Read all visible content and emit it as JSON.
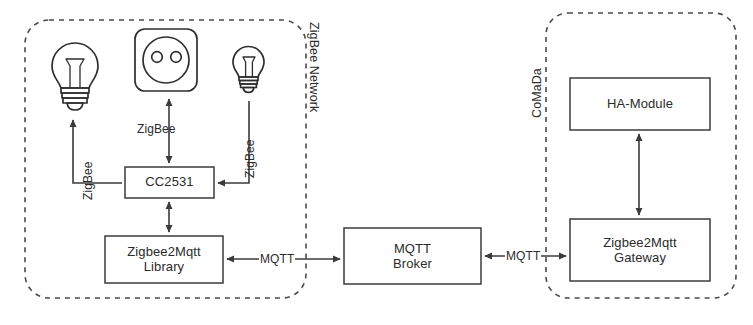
{
  "diagram": {
    "title_present": false,
    "groups": [
      {
        "id": "zigbee-network",
        "label": "ZigBee Network"
      },
      {
        "id": "comada",
        "label": "CoMaDa"
      }
    ],
    "nodes": [
      {
        "id": "lamp-left",
        "kind": "lightbulb-icon",
        "label": ""
      },
      {
        "id": "socket",
        "kind": "power-socket-icon",
        "label": ""
      },
      {
        "id": "lamp-right",
        "kind": "lightbulb-icon",
        "label": ""
      },
      {
        "id": "cc2531",
        "kind": "box",
        "label": "CC2531"
      },
      {
        "id": "zigbee2mqtt-library",
        "kind": "box",
        "label": "Zigbee2Mqtt\nLibrary"
      },
      {
        "id": "mqtt-broker",
        "kind": "box",
        "label": "MQTT\nBroker"
      },
      {
        "id": "ha-module",
        "kind": "box",
        "label": "HA-Module"
      },
      {
        "id": "zigbee2mqtt-gateway",
        "kind": "box",
        "label": "Zigbee2Mqtt\nGateway"
      }
    ],
    "edges": [
      {
        "id": "cc2531-lamp-left",
        "label": "ZigBee",
        "from": "cc2531",
        "to": "lamp-left",
        "arrows": "single"
      },
      {
        "id": "cc2531-socket",
        "label": "ZigBee",
        "from": "cc2531",
        "to": "socket",
        "arrows": "double"
      },
      {
        "id": "cc2531-lamp-right",
        "label": "ZigBee",
        "from": "lamp-right",
        "to": "cc2531",
        "arrows": "single"
      },
      {
        "id": "cc2531-library",
        "label": "",
        "from": "cc2531",
        "to": "zigbee2mqtt-library",
        "arrows": "double"
      },
      {
        "id": "library-broker",
        "label": "MQTT",
        "from": "zigbee2mqtt-library",
        "to": "mqtt-broker",
        "arrows": "double"
      },
      {
        "id": "broker-gateway",
        "label": "MQTT",
        "from": "mqtt-broker",
        "to": "zigbee2mqtt-gateway",
        "arrows": "double"
      },
      {
        "id": "gateway-ha",
        "label": "",
        "from": "zigbee2mqtt-gateway",
        "to": "ha-module",
        "arrows": "double"
      }
    ],
    "colors": {
      "background": "#ffffff",
      "stroke": "#3b3b3b",
      "dashed_stroke": "#4a4a4a",
      "text": "#2b2b2b"
    }
  }
}
